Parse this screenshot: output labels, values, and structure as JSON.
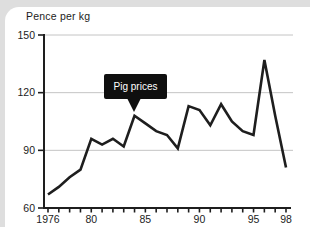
{
  "page": {
    "background": "#dedede",
    "card_background": "#ffffff"
  },
  "chart_data": {
    "type": "line",
    "title": "Pig prices",
    "ylabel": "Pence per kg",
    "xlabel": "",
    "x": [
      1976,
      1977,
      1978,
      1979,
      1980,
      1981,
      1982,
      1983,
      1984,
      1985,
      1986,
      1987,
      1988,
      1989,
      1990,
      1991,
      1992,
      1993,
      1994,
      1995,
      1996,
      1997,
      1998
    ],
    "values": [
      67,
      71,
      76,
      80,
      96,
      93,
      96,
      92,
      108,
      104,
      100,
      98,
      91,
      113,
      111,
      103,
      114,
      105,
      100,
      98,
      137,
      108,
      81
    ],
    "ylim": [
      60,
      150
    ],
    "yticks": [
      60,
      90,
      120,
      150
    ],
    "xtick_labels": [
      {
        "year": 1976,
        "label": "1976"
      },
      {
        "year": 1980,
        "label": "80"
      },
      {
        "year": 1985,
        "label": "85"
      },
      {
        "year": 1990,
        "label": "90"
      },
      {
        "year": 1995,
        "label": "95"
      },
      {
        "year": 1998,
        "label": "98"
      }
    ],
    "grid": "horizontal-light",
    "legend": "none",
    "annotation": {
      "label": "Pig prices",
      "target_year": 1984,
      "target_value": 108
    },
    "colors": {
      "line": "#1e1e1e",
      "axis": "#1e1e1e",
      "grid": "#c4c4c4",
      "text": "#1c1c1c",
      "callout_bg": "#0f0f0f",
      "callout_text": "#ffffff"
    }
  }
}
